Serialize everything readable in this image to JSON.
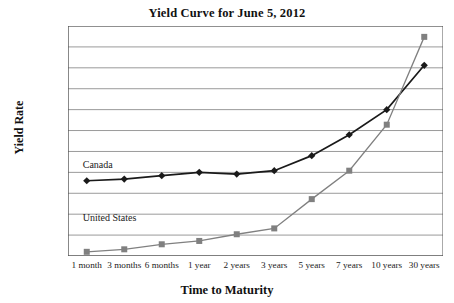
{
  "chart_data": {
    "type": "line",
    "title": "Yield Curve for June 5, 2012",
    "xlabel": "Time to Maturity",
    "ylabel": "Yield Rate",
    "categories": [
      "1 month",
      "3 months",
      "6 months",
      "1 year",
      "2 years",
      "3 years",
      "5 years",
      "7 years",
      "10 years",
      "30 years"
    ],
    "series": [
      {
        "name": "Canada",
        "marker": "diamond",
        "color": "#1a1a1a",
        "values": [
          0.9,
          0.92,
          0.96,
          1.0,
          0.98,
          1.02,
          1.2,
          1.45,
          1.75,
          2.28
        ]
      },
      {
        "name": "United States",
        "marker": "square",
        "color": "#808080",
        "values": [
          0.05,
          0.08,
          0.14,
          0.18,
          0.26,
          0.33,
          0.68,
          1.02,
          1.57,
          2.62
        ]
      }
    ],
    "ylim": [
      0.0,
      2.75
    ],
    "ytick_labels": [
      "0.0%",
      "0.5%",
      "1.0%",
      "1.5%",
      "2.0%",
      "2.5%"
    ],
    "ytick_values": [
      0.0,
      0.5,
      1.0,
      1.5,
      2.0,
      2.5
    ],
    "minor_gridline_values": [
      0.25,
      0.75,
      1.25,
      1.75,
      2.25,
      2.75
    ],
    "grid": true,
    "legend": "inline-labels",
    "annotations": [
      {
        "text": "Canada",
        "x_category": "1 month",
        "value": 1.08
      },
      {
        "text": "United States",
        "x_category": "1 month",
        "value": 0.44
      }
    ]
  },
  "colors": {
    "canada": "#1a1a1a",
    "united_states": "#808080",
    "grid": "#9a9a9a",
    "axis": "#555555",
    "background": "#ffffff"
  }
}
